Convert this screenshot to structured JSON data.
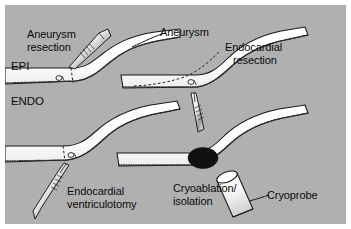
{
  "figure": {
    "background_color": "#b0b0b0",
    "tissue_color": "#ffffff",
    "ink_color": "#0a0a0a",
    "lesion_color": "#111111",
    "width": 351,
    "height": 229
  },
  "wall_labels": {
    "epicardium": "EPI",
    "endocardium": "ENDO"
  },
  "panels": [
    {
      "id": "top-left",
      "label": "Aneurysm\nresection",
      "label_line1": "Aneurysm",
      "label_line2": "resection",
      "instrument": "scalpel",
      "instrument_name": "scalpel-icon",
      "has_dashed_resection_line": true
    },
    {
      "id": "top-right",
      "label": "Endocardial\nresection",
      "label_line1": "Endocardial",
      "label_line2": "resection",
      "instrument": "scalpel",
      "instrument_name": "scalpel-icon",
      "has_dashed_resection_line": true
    },
    {
      "id": "bottom-left",
      "label": "Endocardial\nventriculotomy",
      "label_line1": "Endocardial",
      "label_line2": "ventriculotomy",
      "instrument": "scalpel",
      "instrument_name": "scalpel-icon",
      "has_dashed_resection_line": true
    },
    {
      "id": "bottom-right",
      "label": "Cryoablation/\nisolation",
      "label_line1": "Cryoablation/",
      "label_line2": "isolation",
      "instrument": "cryoprobe",
      "instrument_name": "cryoprobe-icon",
      "instrument_label": "Cryoprobe",
      "has_lesion": true
    }
  ],
  "callouts": {
    "aneurysm": "Aneurysm"
  }
}
